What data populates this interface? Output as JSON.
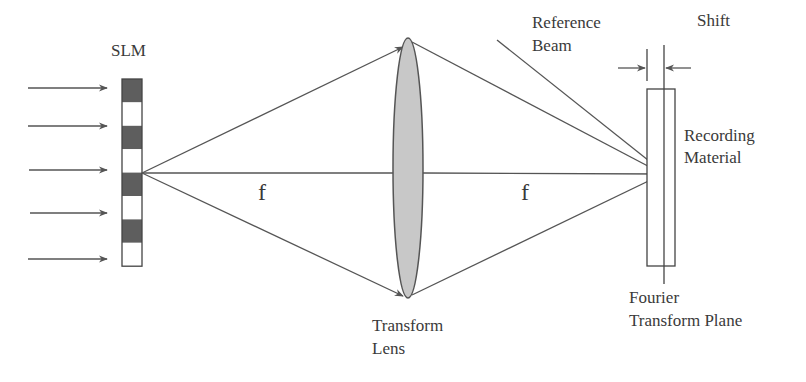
{
  "diagram": {
    "labels": {
      "slm": "SLM",
      "focal_left": "f",
      "focal_right": "f",
      "lens_line1": "Transform",
      "lens_line2": "Lens",
      "reference_line1": "Reference",
      "reference_line2": "Beam",
      "shift": "Shift",
      "material_line1": "Recording",
      "material_line2": "Material",
      "plane_line1": "Fourier",
      "plane_line2": "Transform Plane"
    },
    "slm_cells": [
      "dark",
      "light",
      "dark",
      "light",
      "dark",
      "light",
      "dark",
      "light"
    ],
    "incident_arrows": 5,
    "colors": {
      "dark_cell": "#5e5e5e",
      "light_cell": "#ffffff",
      "lens_fill": "#c8c8c8",
      "line": "#555555",
      "text": "#3a3a3a"
    }
  }
}
